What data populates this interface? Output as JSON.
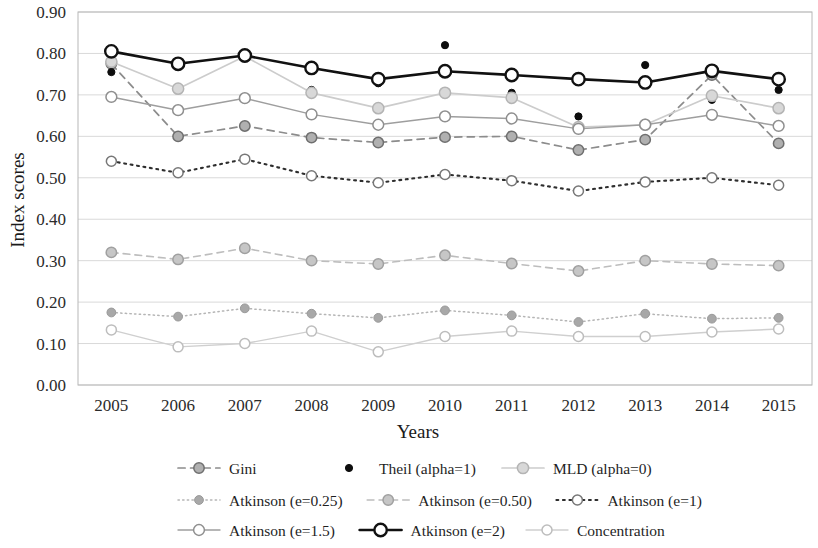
{
  "chart_data": {
    "type": "line",
    "title": "",
    "xlabel": "Years",
    "ylabel": "Index scores",
    "categories": [
      "2005",
      "2006",
      "2007",
      "2008",
      "2009",
      "2010",
      "2011",
      "2012",
      "2013",
      "2014",
      "2015"
    ],
    "x": [
      2005,
      2006,
      2007,
      2008,
      2009,
      2010,
      2011,
      2012,
      2013,
      2014,
      2015
    ],
    "ylim": [
      0.0,
      0.9
    ],
    "ytick_labels": [
      "0.00",
      "0.10",
      "0.20",
      "0.30",
      "0.40",
      "0.50",
      "0.60",
      "0.70",
      "0.80",
      "0.90"
    ],
    "ytick_values": [
      0.0,
      0.1,
      0.2,
      0.3,
      0.4,
      0.5,
      0.6,
      0.7,
      0.8,
      0.9
    ],
    "grid": true,
    "legend_position": "bottom",
    "series": [
      {
        "name": "Gini",
        "values": [
          0.775,
          0.6,
          0.625,
          0.597,
          0.585,
          0.598,
          0.6,
          0.567,
          0.592,
          0.748,
          0.583
        ],
        "color": "#8c8c8c",
        "line_style": "dashed",
        "line_width": 1.7,
        "marker": "circle",
        "marker_fill": "#b0b0b0",
        "marker_stroke": "#6f6f6f",
        "marker_size": 5.2,
        "show_line": true
      },
      {
        "name": "Theil (alpha=1)",
        "values": [
          0.755,
          0.77,
          0.797,
          0.712,
          0.728,
          0.82,
          0.705,
          0.648,
          0.772,
          0.688,
          0.712
        ],
        "color": "#0d0d0d",
        "line_style": "none",
        "line_width": 0,
        "marker": "dot",
        "marker_fill": "#0d0d0d",
        "marker_stroke": "#0d0d0d",
        "marker_size": 3.6,
        "show_line": false
      },
      {
        "name": "MLD (alpha=0)",
        "values": [
          0.78,
          0.715,
          0.793,
          0.705,
          0.668,
          0.705,
          0.693,
          0.622,
          0.628,
          0.698,
          0.668
        ],
        "color": "#cccccc",
        "line_style": "solid",
        "line_width": 1.7,
        "marker": "circle",
        "marker_fill": "#d8d8d8",
        "marker_stroke": "#b4b4b4",
        "marker_size": 5.6,
        "show_line": true
      },
      {
        "name": "Atkinson (e=0.25)",
        "values": [
          0.175,
          0.165,
          0.185,
          0.172,
          0.162,
          0.18,
          0.168,
          0.152,
          0.172,
          0.16,
          0.162
        ],
        "color": "#b5b5b5",
        "line_style": "dotted",
        "line_width": 1.5,
        "marker": "filled-circle",
        "marker_fill": "#a8a8a8",
        "marker_stroke": "#9a9a9a",
        "marker_size": 4.4,
        "show_line": true
      },
      {
        "name": "Atkinson (e=0.50)",
        "values": [
          0.32,
          0.303,
          0.33,
          0.3,
          0.292,
          0.313,
          0.293,
          0.275,
          0.3,
          0.292,
          0.288
        ],
        "color": "#bdbdbd",
        "line_style": "dashed",
        "line_width": 1.6,
        "marker": "circle",
        "marker_fill": "#c6c6c6",
        "marker_stroke": "#a0a0a0",
        "marker_size": 5.2,
        "show_line": true
      },
      {
        "name": "Atkinson (e=1)",
        "values": [
          0.54,
          0.512,
          0.545,
          0.505,
          0.488,
          0.508,
          0.493,
          0.468,
          0.49,
          0.5,
          0.482
        ],
        "color": "#2e2e2e",
        "line_style": "dotted",
        "line_width": 2.1,
        "marker": "circle",
        "marker_fill": "#ffffff",
        "marker_stroke": "#777777",
        "marker_size": 5.0,
        "show_line": true
      },
      {
        "name": "Atkinson (e=1.5)",
        "values": [
          0.695,
          0.663,
          0.692,
          0.653,
          0.628,
          0.648,
          0.643,
          0.618,
          0.628,
          0.652,
          0.625
        ],
        "color": "#9e9e9e",
        "line_style": "solid",
        "line_width": 1.4,
        "marker": "circle",
        "marker_fill": "#ffffff",
        "marker_stroke": "#8f8f8f",
        "marker_size": 5.4,
        "show_line": true
      },
      {
        "name": "Atkinson (e=2)",
        "values": [
          0.805,
          0.775,
          0.795,
          0.765,
          0.738,
          0.757,
          0.748,
          0.738,
          0.73,
          0.758,
          0.738
        ],
        "color": "#111111",
        "line_style": "solid",
        "line_width": 2.6,
        "marker": "circle",
        "marker_fill": "#ffffff",
        "marker_stroke": "#111111",
        "marker_size": 6.2,
        "show_line": true
      },
      {
        "name": "Concentration",
        "values": [
          0.133,
          0.092,
          0.1,
          0.13,
          0.08,
          0.117,
          0.13,
          0.117,
          0.117,
          0.128,
          0.135
        ],
        "color": "#cfcfcf",
        "line_style": "solid",
        "line_width": 1.4,
        "marker": "circle",
        "marker_fill": "#ffffff",
        "marker_stroke": "#bdbdbd",
        "marker_size": 5.0,
        "show_line": true
      }
    ],
    "legend_rows": [
      [
        "Gini",
        "Theil (alpha=1)",
        "MLD (alpha=0)"
      ],
      [
        "Atkinson (e=0.25)",
        "Atkinson (e=0.50)",
        "Atkinson (e=1)"
      ],
      [
        "Atkinson (e=1.5)",
        "Atkinson (e=2)",
        "Concentration"
      ]
    ]
  }
}
